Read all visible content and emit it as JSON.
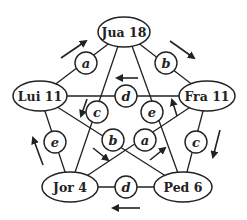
{
  "diagram": {
    "nodes": [
      {
        "id": "jua",
        "label": "Jua 18",
        "cx": 124,
        "cy": 32,
        "rx": 26,
        "ry": 15
      },
      {
        "id": "lui",
        "label": "Lui 11",
        "cx": 40,
        "cy": 96,
        "rx": 27,
        "ry": 15
      },
      {
        "id": "fra",
        "label": "Fra 11",
        "cx": 207,
        "cy": 96,
        "rx": 28,
        "ry": 15
      },
      {
        "id": "jor",
        "label": "Jor 4",
        "cx": 70,
        "cy": 187,
        "rx": 28,
        "ry": 15
      },
      {
        "id": "ped",
        "label": "Ped 6",
        "cx": 183,
        "cy": 187,
        "rx": 29,
        "ry": 15
      }
    ],
    "edge_labels": [
      {
        "id": "a1",
        "label": "a",
        "cx": 86,
        "cy": 63,
        "from": "lui",
        "to": "jua"
      },
      {
        "id": "b1",
        "label": "b",
        "cx": 166,
        "cy": 63,
        "from": "jua",
        "to": "fra"
      },
      {
        "id": "d1",
        "label": "d",
        "cx": 126,
        "cy": 96,
        "from": "fra",
        "to": "lui"
      },
      {
        "id": "c1",
        "label": "c",
        "cx": 97,
        "cy": 112,
        "from": "jua",
        "to": "jor"
      },
      {
        "id": "e1",
        "label": "e",
        "cx": 152,
        "cy": 112,
        "from": "ped",
        "to": "jua"
      },
      {
        "id": "b2",
        "label": "b",
        "cx": 113,
        "cy": 140,
        "from": "lui",
        "to": "ped"
      },
      {
        "id": "a2",
        "label": "a",
        "cx": 145,
        "cy": 140,
        "from": "jor",
        "to": "fra"
      },
      {
        "id": "e2",
        "label": "e",
        "cx": 55,
        "cy": 142,
        "from": "jor",
        "to": "lui"
      },
      {
        "id": "c2",
        "label": "c",
        "cx": 196,
        "cy": 142,
        "from": "fra",
        "to": "ped"
      },
      {
        "id": "d2",
        "label": "d",
        "cx": 126,
        "cy": 187,
        "from": "ped",
        "to": "jor"
      }
    ]
  }
}
